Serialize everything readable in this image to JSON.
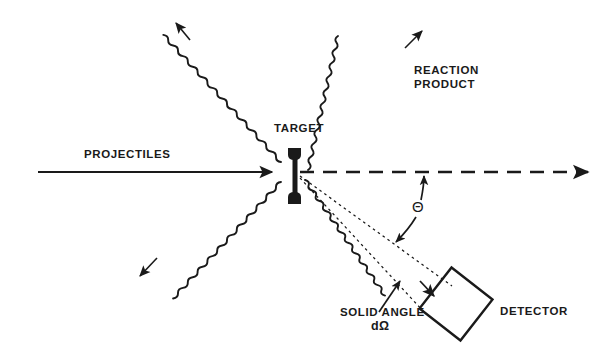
{
  "figure": {
    "background_color": "#ffffff",
    "ink_color": "#1a1a1a"
  },
  "labels": {
    "projectiles": "PROJECTILES",
    "target": "TARGET",
    "reaction_line1": "REACTION",
    "reaction_line2": "PRODUCT",
    "theta": "Θ",
    "solid_angle_line1": "SOLID ANGLE",
    "solid_angle_line2": "dΩ",
    "detector": "DETECTOR"
  },
  "elements": {
    "beam_arrow": "incident-projectile-beam",
    "beam_axis": "dashed-undeflected-beam-axis",
    "target_foil": "target-holder",
    "scattered_waves": [
      "wave-upper-left",
      "wave-upper-right-reaction-product",
      "wave-lower-left",
      "wave-lower-right-to-detector"
    ],
    "solid_angle_cone": "dotted-acceptance-cone",
    "detector_body": "square-detector",
    "theta_arc_arrow": "scattering-angle-indicator"
  }
}
